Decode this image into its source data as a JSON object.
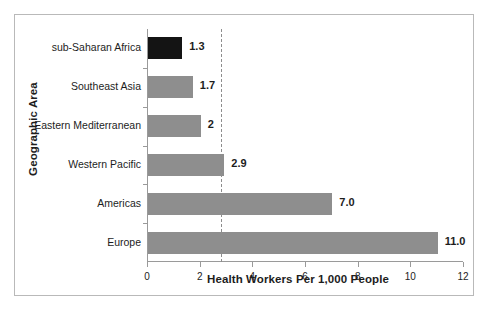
{
  "figure": {
    "frame_border_color": "#b9b9b9",
    "background_color": "#ffffff",
    "caption": ""
  },
  "axes": {
    "y_title": "Geographic Area",
    "x_title": "Health Workers Per 1,000 People"
  },
  "chart_data": {
    "type": "bar",
    "orientation": "horizontal",
    "title": "",
    "subtitle": "",
    "xlabel": "Health Workers Per 1,000 People",
    "ylabel": "Geographic Area",
    "categories": [
      "sub-Saharan Africa",
      "Southeast Asia",
      "Eastern Mediterranean",
      "Western Pacific",
      "Americas",
      "Europe"
    ],
    "values": [
      1.3,
      1.7,
      2.0,
      2.9,
      7.0,
      11.0
    ],
    "value_labels": [
      "1.3",
      "1.7",
      "2",
      "2.9",
      "7.0",
      "11.0"
    ],
    "bar_colors": [
      "#141414",
      "#8e8e8e",
      "#8e8e8e",
      "#8e8e8e",
      "#8e8e8e",
      "#8e8e8e"
    ],
    "xlim": [
      0,
      12
    ],
    "xticks": [
      0,
      2,
      4,
      6,
      8,
      10,
      12
    ],
    "xtick_labels": [
      "0",
      "2",
      "4",
      "6",
      "8",
      "10",
      "12"
    ],
    "grid": false,
    "legend": null,
    "annotations": [
      {
        "kind": "reference-line",
        "orientation": "vertical",
        "value": 2.8,
        "style": "dotted",
        "color": "#8d8d8d",
        "label": ""
      }
    ]
  }
}
